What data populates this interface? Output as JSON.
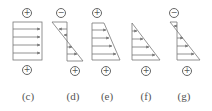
{
  "figure": {
    "panels": [
      {
        "id": "c",
        "label": "(c)",
        "top_sign": "+",
        "bottom_sign": "+",
        "shape": "rectangle"
      },
      {
        "id": "d",
        "label": "(d)",
        "top_sign": "−",
        "bottom_sign": "+",
        "shape": "double-triangle"
      },
      {
        "id": "e",
        "label": "(e)",
        "top_sign": "+",
        "bottom_sign": "+",
        "shape": "trapezoid"
      },
      {
        "id": "f",
        "label": "(f)",
        "top_sign": "",
        "bottom_sign": "+",
        "shape": "triangle"
      },
      {
        "id": "g",
        "label": "(g)",
        "top_sign": "−",
        "bottom_sign": "+",
        "shape": "double-triangle-small-top"
      }
    ],
    "colors": {
      "line": "#777777",
      "text": "#555555"
    }
  }
}
